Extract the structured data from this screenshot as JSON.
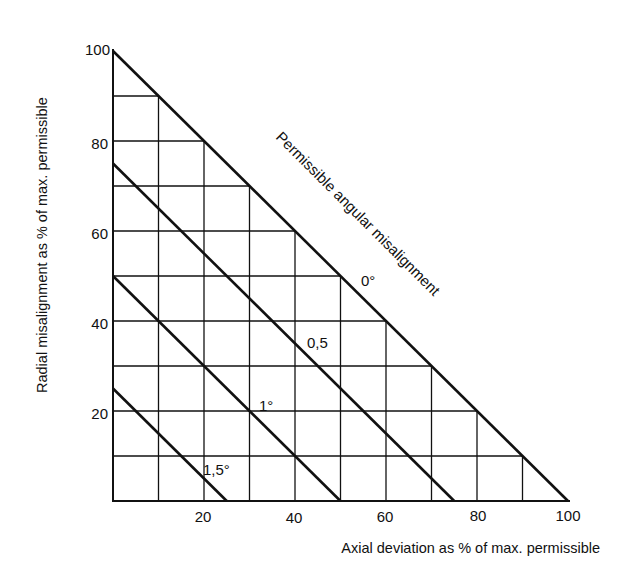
{
  "chart_data": {
    "type": "line",
    "title": "",
    "xlabel": "Axial deviation as % of max. permissible",
    "ylabel": "Radial misalignment as % of max. permissible",
    "xlim": [
      0,
      100
    ],
    "ylim": [
      0,
      100
    ],
    "grid": true,
    "grid_step": 10,
    "x_ticks": [
      20,
      40,
      60,
      80,
      100
    ],
    "y_ticks": [
      20,
      40,
      60,
      80,
      100
    ],
    "series_title": "Permissible angular misalignment",
    "series": [
      {
        "name": "0°",
        "x": [
          0,
          100
        ],
        "y": [
          100,
          0
        ]
      },
      {
        "name": "0,5",
        "x": [
          0,
          75
        ],
        "y": [
          75,
          0
        ]
      },
      {
        "name": "1°",
        "x": [
          0,
          50
        ],
        "y": [
          50,
          0
        ]
      },
      {
        "name": "1,5°",
        "x": [
          0,
          25
        ],
        "y": [
          25,
          0
        ]
      }
    ],
    "annotations": [
      {
        "text": "0°",
        "x": 56,
        "y": 44
      },
      {
        "text": "0,5",
        "x": 43,
        "y": 34
      },
      {
        "text": "1°",
        "x": 31,
        "y": 21
      },
      {
        "text": "1,5°",
        "x": 20,
        "y": 8
      },
      {
        "text": "Permissible angular misalignment",
        "rotation": -45
      }
    ]
  },
  "labels": {
    "xlabel": "Axial deviation as % of max. permissible",
    "ylabel": "Radial misalignment as % of max. permissible",
    "series_title": "Permissible angular misalignment",
    "x_ticks": [
      "20",
      "40",
      "60",
      "80",
      "100"
    ],
    "y_ticks": [
      "20",
      "40",
      "60",
      "80",
      "100"
    ],
    "line_labels": [
      "0°",
      "0,5",
      "1°",
      "1,5°"
    ]
  }
}
